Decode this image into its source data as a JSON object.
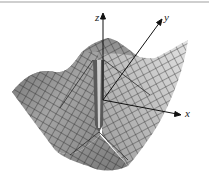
{
  "figure": {
    "type": "3d-surface-wireframe",
    "colors": {
      "surface_light": "#d8d8d8",
      "surface_mid": "#a8a8a8",
      "surface_dark": "#707070",
      "mesh_lines": "#2a2a2a",
      "axes": "#111111",
      "background": "#ffffff"
    },
    "axes": {
      "z_label": "z",
      "y_label": "y",
      "x_label": "x"
    }
  }
}
